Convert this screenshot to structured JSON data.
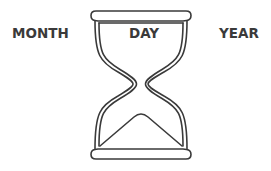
{
  "labels": {
    "left": "MONTH",
    "center": "DAY",
    "right": "YEAR"
  },
  "illustration": {
    "icon": "hourglass-icon",
    "stroke_color": "#3a3a3a",
    "background_color": "#ffffff"
  }
}
